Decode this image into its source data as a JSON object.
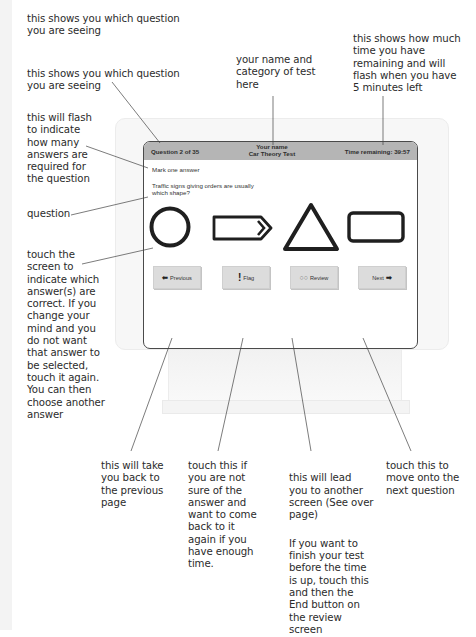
{
  "callouts": {
    "question_counter": "this shows you which question\nyou are seeing",
    "candidate_name": "your name and\ncategory of test\nhere",
    "time_remaining": "this shows how much\ntime you have\nremaining and will\nflash when you have\n5 minutes left",
    "answers_required": "this will flash\nto indicate\nhow many\nanswers are\nrequired for\nthe question",
    "question": "question",
    "touch_screen": "touch the\nscreen to\nindicate which\nanswer(s) are\ncorrect. If you\nchange your\nmind and you\ndo not want\nthat answer to\nbe selected,\ntouch it again.\nYou can then\nchoose another\nanswer",
    "previous": "this will take\nyou back to\nthe previous\npage",
    "flag": "touch this if\nyou are not\nsure of the\nanswer and\nwant to come\nback to it\nagain if you\nhave enough\ntime.",
    "review_1": "this will lead\nyou  to another\nscreen (See over\npage)",
    "review_2": "If you want to\nfinish your test\nbefore the time\nis up, touch this\nand then the\nEnd button on\nthe review\nscreen",
    "next": "touch this to\nmove onto the\nnext question"
  },
  "screen": {
    "header": {
      "question_counter": "Question 2 of 35",
      "candidate_name": "Your name",
      "test_category": "Car Theory Test",
      "time_remaining": "Time remaining: 39:57"
    },
    "instruction": "Mark one answer",
    "question": "Traffic signs giving orders are usually which shape?",
    "answers": [
      {
        "shape": "circle"
      },
      {
        "shape": "arrow-rectangle"
      },
      {
        "shape": "triangle"
      },
      {
        "shape": "rectangle"
      }
    ],
    "buttons": {
      "previous": {
        "label": "Previous",
        "icon": "⬅"
      },
      "flag": {
        "label": "Flag",
        "icon": "!"
      },
      "review": {
        "label": "Review",
        "icon": "○○"
      },
      "next": {
        "label": "Next",
        "icon": "➡"
      }
    }
  },
  "colors": {
    "header_bg": "#b5b5b5",
    "button_bg": "#dcdcdc",
    "shape_stroke": "#1f1f1f",
    "text": "#2b2b2b"
  }
}
